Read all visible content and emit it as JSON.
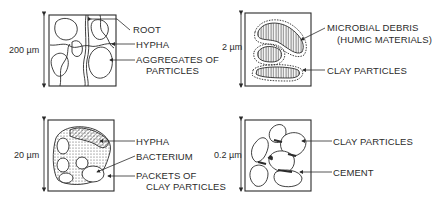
{
  "panels": [
    {
      "id": "top-left",
      "scale": "200 µm",
      "labels": [
        "ROOT",
        "HYPHA",
        "AGGREGATES OF",
        "PARTICLES"
      ]
    },
    {
      "id": "top-right",
      "scale": "2 µm",
      "labels": [
        "MICROBIAL DEBRIS",
        "(HUMIC MATERIALS)",
        "CLAY PARTICLES"
      ]
    },
    {
      "id": "bottom-left",
      "scale": "20 µm",
      "labels": [
        "HYPHA",
        "BACTERIUM",
        "PACKETS OF",
        "CLAY PARTICLES"
      ]
    },
    {
      "id": "bottom-right",
      "scale": "0.2 µm",
      "labels": [
        "CLAY PARTICLES",
        "CEMENT"
      ]
    }
  ],
  "colors": {
    "ink": "#2b2b2b",
    "background": "#ffffff"
  }
}
